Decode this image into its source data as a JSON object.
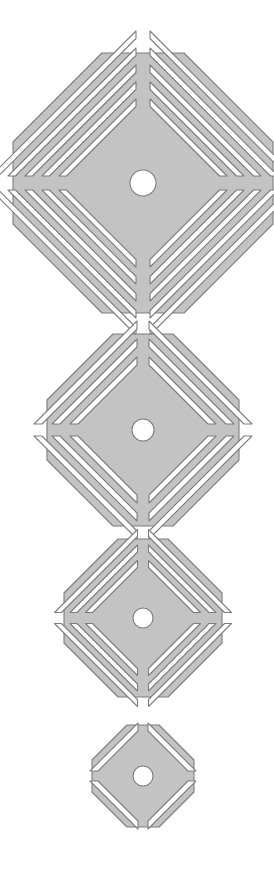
{
  "canvas": {
    "width": 274,
    "height": 895,
    "background": "#ffffff",
    "title": "Octagonal grate drain covers — four sizes"
  },
  "style": {
    "fill_color": "#c3c3c3",
    "stroke_color": "#7d7d7d",
    "stroke_width": 1.1,
    "hole_color": "#ffffff",
    "slot_color": "#ffffff"
  },
  "shapes": [
    {
      "name": "grate-extra-large",
      "label": "Octagonal grate, extra large",
      "center_x": 143,
      "center_y": 183,
      "radius": 130,
      "flat_half": 41,
      "hole_radius": 13,
      "spoke_half_width": 7,
      "rim_width": 12,
      "slots_per_quadrant": 5,
      "slot_width": 7.5,
      "slot_gap": 9.5
    },
    {
      "name": "grate-large",
      "label": "Octagonal grate, large",
      "center_x": 143,
      "center_y": 430,
      "radius": 96,
      "flat_half": 30,
      "hole_radius": 11,
      "spoke_half_width": 6,
      "rim_width": 11,
      "slots_per_quadrant": 3,
      "slot_width": 8,
      "slot_gap": 10
    },
    {
      "name": "grate-medium",
      "label": "Octagonal grate, medium",
      "center_x": 143,
      "center_y": 618,
      "radius": 79,
      "flat_half": 25,
      "hole_radius": 10,
      "spoke_half_width": 5.5,
      "rim_width": 10,
      "slots_per_quadrant": 3,
      "slot_width": 7,
      "slot_gap": 8.5
    },
    {
      "name": "grate-small",
      "label": "Octagonal grate, small",
      "center_x": 143,
      "center_y": 776,
      "radius": 51,
      "flat_half": 16,
      "hole_radius": 10,
      "spoke_half_width": 5,
      "rim_width": 9,
      "slots_per_quadrant": 1,
      "slot_width": 8,
      "slot_gap": 9
    }
  ]
}
